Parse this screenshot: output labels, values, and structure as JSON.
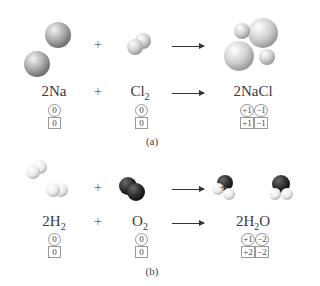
{
  "panels": [
    {
      "label": "(a)",
      "reactants": [
        {
          "formula": "2Na",
          "oxidation_number": "0",
          "charge": "0"
        },
        {
          "formula": "Cl",
          "subscript": "2",
          "oxidation_number": "0",
          "charge": "0"
        }
      ],
      "plus": "+",
      "product": {
        "formula": "2NaCl",
        "oxidation_numbers": [
          "+1",
          "−1"
        ],
        "charges": [
          "+1",
          "−1"
        ]
      }
    },
    {
      "label": "(b)",
      "reactants": [
        {
          "formula": "2H",
          "subscript": "2",
          "oxidation_number": "0",
          "charge": "0"
        },
        {
          "formula": "O",
          "subscript": "2",
          "oxidation_number": "0",
          "charge": "0"
        }
      ],
      "plus": "+",
      "product": {
        "formula_pre": "2H",
        "subscript": "2",
        "formula_post": "O",
        "oxidation_numbers": [
          "+1",
          "−2"
        ],
        "charges": [
          "+2",
          "−2"
        ]
      }
    }
  ],
  "colors": {
    "sodium": "#b8b8b8",
    "chlorine": "#d8d8d8",
    "hydrogen": "#f2f2f2",
    "oxygen": "#2e2e2e"
  }
}
